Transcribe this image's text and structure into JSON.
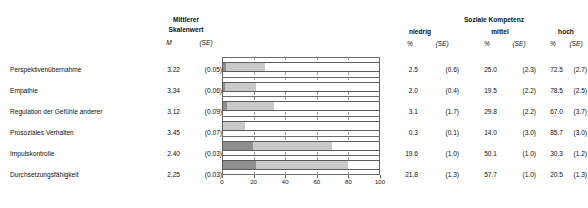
{
  "headers": {
    "mean_group": "Mittlerer Skalenwert",
    "mean_group_line1": "Mittlerer",
    "mean_group_line2": "Skalenwert",
    "mean_symbol": "M",
    "se_symbol": "(SE)",
    "competence_group": "Soziale Kompetenz",
    "level_low": "niedrig",
    "level_mid": "mittel",
    "level_high": "hoch",
    "pct_symbol": "%"
  },
  "rows": [
    {
      "label": "Perspektivenübernahme",
      "mean": "3.22",
      "mean_se": "(0.05)",
      "low_pct": "2.5",
      "low_se": "(0.6)",
      "mid_pct": "25.0",
      "mid_se": "(2.3)",
      "high_pct": "72.5",
      "high_se": "(2.7)"
    },
    {
      "label": "Empathie",
      "mean": "3.34",
      "mean_se": "(0.06)",
      "low_pct": "2.0",
      "low_se": "(0.4)",
      "mid_pct": "19.5",
      "mid_se": "(2.2)",
      "high_pct": "78.5",
      "high_se": "(2.5)"
    },
    {
      "label": "Regulation der Gefühle anderer",
      "mean": "3.12",
      "mean_se": "(0.09)",
      "low_pct": "3.1",
      "low_se": "(1.7)",
      "mid_pct": "29.8",
      "mid_se": "(2.2)",
      "high_pct": "67.0",
      "high_se": "(3.7)"
    },
    {
      "label": "Prosoziales Verhalten",
      "mean": "3.45",
      "mean_se": "(0.07)",
      "low_pct": "0.3",
      "low_se": "(0.1)",
      "mid_pct": "14.0",
      "mid_se": "(3.0)",
      "high_pct": "85.7",
      "high_se": "(3.0)"
    },
    {
      "label": "Impulskontrolle",
      "mean": "2.40",
      "mean_se": "(0.03)",
      "low_pct": "19.6",
      "low_se": "(1.0)",
      "mid_pct": "50.1",
      "mid_se": "(1.0)",
      "high_pct": "30.3",
      "high_se": "(1.2)"
    },
    {
      "label": "Durchsetzungsfähigkeit",
      "mean": "2.25",
      "mean_se": "(0.03)",
      "low_pct": "21.8",
      "low_se": "(1.3)",
      "mid_pct": "57.7",
      "mid_se": "(1.0)",
      "high_pct": "20.5",
      "high_se": "(1.3)"
    }
  ],
  "chart_data": {
    "type": "bar",
    "orientation": "horizontal",
    "stacked": true,
    "title": "",
    "xlabel": "",
    "ylabel": "",
    "xlim": [
      0,
      100
    ],
    "xticks": [
      "0",
      "20",
      "40",
      "60",
      "80",
      "100"
    ],
    "xtick_values": [
      0,
      20,
      40,
      60,
      80,
      100
    ],
    "grid": "vertical-dashed",
    "legend_position": "none",
    "categories": [
      "Perspektivenübernahme",
      "Empathie",
      "Regulation der Gefühle anderer",
      "Prosoziales Verhalten",
      "Impulskontrolle",
      "Durchsetzungsfähigkeit"
    ],
    "series": [
      {
        "name": "niedrig",
        "color": "#8e8e8e",
        "values": [
          2.5,
          2.0,
          3.1,
          0.3,
          19.6,
          21.8
        ]
      },
      {
        "name": "mittel",
        "color": "#c9c9c9",
        "values": [
          25.0,
          19.5,
          29.8,
          14.0,
          50.1,
          57.7
        ]
      },
      {
        "name": "hoch",
        "color": "#ffffff",
        "values": [
          72.5,
          78.5,
          67.0,
          85.7,
          30.3,
          20.5
        ]
      }
    ]
  },
  "colors": {
    "low": "#8e8e8e",
    "mid": "#c9c9c9",
    "high": "#ffffff",
    "outline": "#5d5d5d",
    "grid": "#9a9a9a",
    "text": "#111111"
  },
  "layout": {
    "row_y": [
      69,
      90,
      111,
      132,
      153,
      174
    ],
    "col_x": {
      "mean": 172,
      "mean_se": 213,
      "low_pct": 414,
      "low_se": 452,
      "mid_pct": 491,
      "mid_se": 529,
      "high_pct": 557,
      "high_se": 586
    },
    "chart": {
      "left": 222,
      "top": 57,
      "width": 158,
      "height": 118
    }
  }
}
